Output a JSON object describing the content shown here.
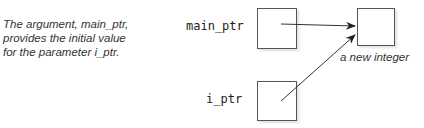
{
  "caption": {
    "lines": [
      "The argument, main_ptr,",
      "provides the initial value",
      "for the parameter i_ptr."
    ]
  },
  "variables": {
    "main_ptr": "main_ptr",
    "i_ptr": "i_ptr"
  },
  "target": {
    "label": "a new integer"
  },
  "colors": {
    "line": "#333333",
    "box_border": "#555555",
    "text": "#333333"
  }
}
